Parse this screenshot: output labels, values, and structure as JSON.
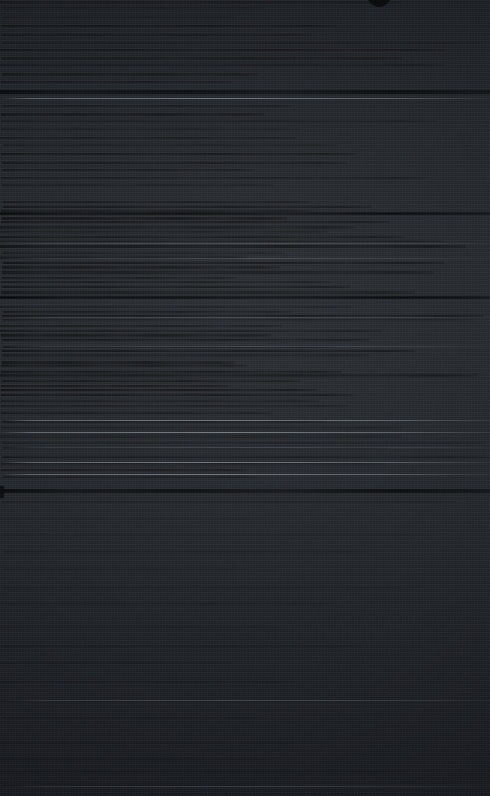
{
  "image": {
    "kind": "mobile-phone-screenshot",
    "theme": "dark",
    "width_px": 490,
    "height_px": 796,
    "legibility": "no-text-recoverable",
    "description": "Near-black dark-theme mobile screen, severely degraded by compression; only horizontal banding and divider rules remain visible. No glyphs, icons or labels are resolvable at any zoom level."
  },
  "colors": {
    "background": "#22252a",
    "background_top": "#1e2126",
    "background_mid": "#262a2f",
    "background_bottom": "#1d2025",
    "rule_bright": "#9aa2ac",
    "rule_dim": "#828a94",
    "separator_dark": "#000000",
    "notch": "#0a0c0e"
  },
  "notch": {
    "name": "camera-punch-hole",
    "x": 366,
    "y": -9,
    "width": 26,
    "height": 16
  },
  "edge_blip": {
    "name": "left-edge-marker",
    "x": 0,
    "y": 486,
    "width": 4,
    "height": 12
  },
  "content_bands": [
    {
      "id": "status-bar",
      "y": 0,
      "height": 22,
      "density": "low",
      "line_count": 3,
      "line_gap": 7
    },
    {
      "id": "header-block",
      "y": 24,
      "height": 62,
      "density": "medium",
      "line_count": 8,
      "line_gap": 8
    },
    {
      "id": "body-block-1",
      "y": 104,
      "height": 88,
      "density": "medium",
      "line_count": 11,
      "line_gap": 8
    },
    {
      "id": "body-block-2",
      "y": 200,
      "height": 100,
      "density": "high",
      "line_count": 20,
      "line_gap": 5
    },
    {
      "id": "body-block-3",
      "y": 304,
      "height": 104,
      "density": "high",
      "line_count": 21,
      "line_gap": 5
    },
    {
      "id": "body-block-4",
      "y": 412,
      "height": 70,
      "density": "medium",
      "line_count": 10,
      "line_gap": 7
    },
    {
      "id": "lower-block-1",
      "y": 500,
      "height": 120,
      "density": "very-low",
      "line_count": 7,
      "line_gap": 17
    },
    {
      "id": "lower-block-2",
      "y": 626,
      "height": 110,
      "density": "very-low",
      "line_count": 6,
      "line_gap": 18
    },
    {
      "id": "footer-block",
      "y": 742,
      "height": 54,
      "density": "very-low",
      "line_count": 4,
      "line_gap": 14
    }
  ],
  "rules": [
    {
      "id": "rule-top",
      "y": 98,
      "style": "bright"
    },
    {
      "id": "rule-mid-a",
      "y": 243,
      "style": "dim"
    },
    {
      "id": "rule-mid-b",
      "y": 258,
      "style": "dim"
    },
    {
      "id": "rule-mid-c",
      "y": 317,
      "style": "dim"
    },
    {
      "id": "rule-mid-d",
      "y": 346,
      "style": "dim"
    },
    {
      "id": "rule-block-a",
      "y": 420,
      "style": "bright"
    },
    {
      "id": "rule-block-b",
      "y": 432,
      "style": "bright"
    },
    {
      "id": "rule-block-c",
      "y": 447,
      "style": "dim"
    },
    {
      "id": "rule-block-d",
      "y": 462,
      "style": "bright"
    },
    {
      "id": "rule-block-e",
      "y": 474,
      "style": "bright"
    },
    {
      "id": "rule-lower",
      "y": 700,
      "style": "dim"
    },
    {
      "id": "rule-footer",
      "y": 786,
      "style": "dim"
    }
  ],
  "separators": [
    {
      "id": "separator-header",
      "y": 90,
      "height": 4
    },
    {
      "id": "separator-mid",
      "y": 212,
      "height": 3
    },
    {
      "id": "separator-body",
      "y": 296,
      "height": 3
    },
    {
      "id": "separator-main",
      "y": 489,
      "height": 4
    }
  ]
}
